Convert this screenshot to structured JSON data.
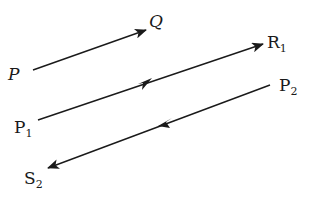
{
  "diagram": {
    "title": "",
    "line_color": "#1a1a1a",
    "vectors": [
      {
        "id": "PQ",
        "from_label": "P",
        "to_label": "Q",
        "from_sub": "",
        "to_sub": "",
        "arrow": "head",
        "italic": true
      },
      {
        "id": "P1R1",
        "from_label": "P",
        "from_sub": "1",
        "to_label": "R",
        "to_sub": "1",
        "arrow": "head-and-middle",
        "italic": false
      },
      {
        "id": "P2S2",
        "from_label": "P",
        "from_sub": "2",
        "to_label": "S",
        "to_sub": "2",
        "arrow": "head-and-middle",
        "italic": false
      }
    ]
  }
}
